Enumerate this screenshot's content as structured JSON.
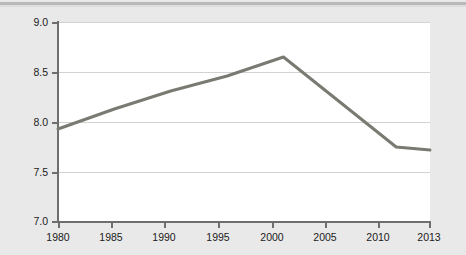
{
  "chart_data": {
    "type": "line",
    "title": "",
    "xlabel": "",
    "ylabel": "EFW rating",
    "x": [
      1980,
      1985,
      1990,
      1995,
      2000,
      2005,
      2010,
      2013
    ],
    "values": [
      7.93,
      8.13,
      8.31,
      8.46,
      8.65,
      8.2,
      7.75,
      7.72
    ],
    "xticklabels": [
      "1980",
      "1985",
      "1990",
      "1995",
      "2000",
      "2005",
      "2010",
      "2013"
    ],
    "yticklabels": [
      "7.0",
      "7.5",
      "8.0",
      "8.5",
      "9.0"
    ],
    "yticks": [
      7.0,
      7.5,
      8.0,
      8.5,
      9.0
    ],
    "xlim": [
      1980,
      2013
    ],
    "ylim": [
      7.0,
      9.0
    ],
    "grid": "horizontal",
    "legend": "none",
    "series": [
      {
        "name": "EFW rating",
        "color": "#7a7a72",
        "values": [
          7.93,
          8.13,
          8.31,
          8.46,
          8.65,
          8.2,
          7.75,
          7.72
        ]
      }
    ]
  },
  "figure": {
    "background_color": "#e9e9e9",
    "plot_background_color": "#ffffff",
    "gridline_color": "#d2d2d2",
    "axis_color": "#6e6e6e",
    "text_color": "#1b1b1b"
  }
}
